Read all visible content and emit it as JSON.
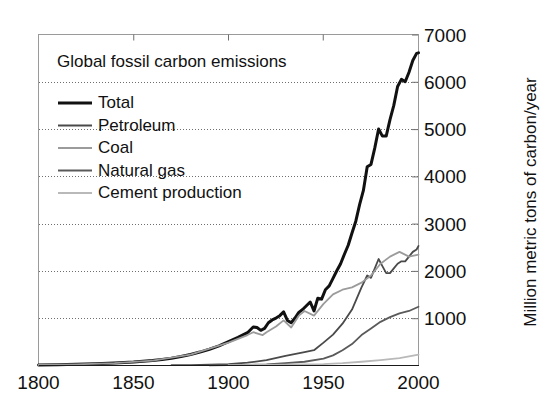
{
  "chart_data": {
    "type": "line",
    "title": "Global fossil carbon emissions",
    "xlabel": "",
    "ylabel": "Million metric tons of carbon/year",
    "xlim": [
      1800,
      2000
    ],
    "ylim": [
      0,
      7000
    ],
    "xticks": [
      "1800",
      "1850",
      "1900",
      "1950",
      "2000"
    ],
    "xtick_values": [
      1800,
      1850,
      1900,
      1950,
      2000
    ],
    "yticks": [
      "1000",
      "2000",
      "3000",
      "4000",
      "5000",
      "6000",
      "7000"
    ],
    "ytick_values": [
      1000,
      2000,
      3000,
      4000,
      5000,
      6000,
      7000
    ],
    "y_axis_side": "right",
    "grid": true,
    "grid_style": "dotted",
    "legend_position": "upper-left-inside",
    "series": [
      {
        "name": "Total",
        "color": "#111111",
        "width": 3.0,
        "x": [
          1800,
          1810,
          1820,
          1830,
          1840,
          1850,
          1855,
          1860,
          1865,
          1870,
          1875,
          1880,
          1885,
          1890,
          1895,
          1900,
          1905,
          1910,
          1913,
          1915,
          1917,
          1919,
          1921,
          1923,
          1925,
          1927,
          1929,
          1931,
          1933,
          1935,
          1937,
          1939,
          1941,
          1943,
          1945,
          1947,
          1949,
          1951,
          1953,
          1955,
          1957,
          1959,
          1961,
          1963,
          1965,
          1967,
          1969,
          1971,
          1973,
          1975,
          1977,
          1979,
          1981,
          1983,
          1985,
          1987,
          1989,
          1991,
          1993,
          1995,
          1997,
          1999,
          2000
        ],
        "values": [
          8,
          14,
          22,
          35,
          50,
          70,
          85,
          100,
          125,
          150,
          185,
          230,
          280,
          340,
          410,
          500,
          590,
          690,
          810,
          800,
          740,
          780,
          900,
          960,
          1000,
          1050,
          1130,
          950,
          900,
          1000,
          1120,
          1180,
          1260,
          1340,
          1150,
          1420,
          1400,
          1600,
          1680,
          1840,
          2000,
          2150,
          2350,
          2540,
          2800,
          3050,
          3400,
          3700,
          4200,
          4250,
          4600,
          5000,
          4850,
          4850,
          5200,
          5500,
          5900,
          6050,
          6000,
          6200,
          6450,
          6600,
          6611
        ]
      },
      {
        "name": "Petroleum",
        "color": "#4a4a4a",
        "width": 1.8,
        "x": [
          1870,
          1880,
          1890,
          1900,
          1910,
          1920,
          1930,
          1940,
          1945,
          1950,
          1955,
          1960,
          1965,
          1970,
          1973,
          1975,
          1977,
          1979,
          1981,
          1983,
          1985,
          1987,
          1989,
          1991,
          1993,
          1995,
          1997,
          1999,
          2000
        ],
        "values": [
          2,
          5,
          12,
          25,
          55,
          110,
          200,
          280,
          320,
          480,
          650,
          880,
          1180,
          1650,
          1900,
          1850,
          2050,
          2250,
          2100,
          1950,
          1950,
          2050,
          2150,
          2200,
          2200,
          2300,
          2400,
          2450,
          2526
        ]
      },
      {
        "name": "Coal",
        "color": "#9b9b9b",
        "width": 1.8,
        "x": [
          1800,
          1820,
          1840,
          1860,
          1880,
          1900,
          1910,
          1913,
          1918,
          1920,
          1925,
          1929,
          1933,
          1937,
          1940,
          1945,
          1950,
          1955,
          1960,
          1965,
          1970,
          1975,
          1980,
          1985,
          1990,
          1995,
          2000
        ],
        "values": [
          8,
          20,
          48,
          98,
          225,
          480,
          640,
          700,
          640,
          700,
          820,
          950,
          800,
          1050,
          1150,
          1050,
          1300,
          1500,
          1600,
          1650,
          1750,
          1900,
          2150,
          2300,
          2400,
          2300,
          2342
        ]
      },
      {
        "name": "Natural gas",
        "color": "#5a5a5a",
        "width": 1.8,
        "x": [
          1890,
          1900,
          1910,
          1920,
          1930,
          1940,
          1950,
          1955,
          1960,
          1965,
          1970,
          1975,
          1980,
          1985,
          1990,
          1995,
          2000
        ],
        "values": [
          1,
          3,
          8,
          18,
          45,
          75,
          140,
          210,
          320,
          450,
          640,
          780,
          920,
          1020,
          1100,
          1150,
          1239
        ]
      },
      {
        "name": "Cement production",
        "color": "#b9b9b9",
        "width": 1.8,
        "x": [
          1900,
          1920,
          1940,
          1950,
          1960,
          1970,
          1980,
          1990,
          2000
        ],
        "values": [
          2,
          8,
          18,
          25,
          45,
          75,
          110,
          150,
          226
        ]
      }
    ]
  },
  "legend": {
    "items": [
      {
        "label": "Total"
      },
      {
        "label": "Petroleum"
      },
      {
        "label": "Coal"
      },
      {
        "label": "Natural gas"
      },
      {
        "label": "Cement production"
      }
    ]
  },
  "figure": {
    "background": "#ffffff",
    "frame_color": "#9a9a9a",
    "grid_color": "#6f6f6f"
  }
}
